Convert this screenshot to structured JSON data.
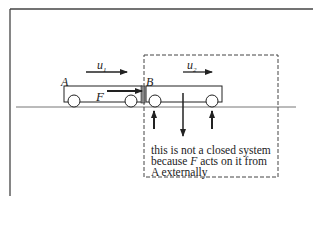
{
  "diagram": {
    "labels": {
      "body_a": "A",
      "body_b": "B",
      "velocity_a": "u",
      "velocity_a_sub": "1",
      "velocity_b": "u",
      "velocity_b_sub": "2",
      "force": "F"
    },
    "caption": {
      "line1": "this is not a closed system",
      "line2_pre": "because ",
      "line2_var": "F",
      "line2_post": " acts on it from",
      "line3": "A externally"
    },
    "colors": {
      "ink": "#222222",
      "frame": "#444444",
      "ground": "#777777",
      "background": "#ffffff"
    }
  }
}
